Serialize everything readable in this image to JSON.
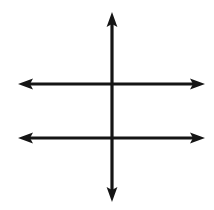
{
  "canvas": {
    "width": 214,
    "height": 210,
    "background_color": "#ffffff",
    "stroke_color": "#151515",
    "title": "Crossed double-headed arrows diagram"
  },
  "chart_data": {
    "type": "diagram",
    "title": "Crossed double-headed arrows diagram",
    "xlabel": "",
    "ylabel": "",
    "axis_ranges": {
      "x": [
        0,
        214
      ],
      "y": [
        0,
        210
      ]
    },
    "grid": false,
    "legend": false,
    "stroke_width": 3.2,
    "arrowhead": {
      "length": 15,
      "half_width": 5.4,
      "notch": 3.0
    },
    "shapes": [
      {
        "name": "vertical-double-arrow",
        "orientation": "vertical",
        "x": 112,
        "y_start": 12,
        "y_end": 202,
        "heads": [
          "start",
          "end"
        ],
        "color": "#151515"
      },
      {
        "name": "upper-horizontal-double-arrow",
        "orientation": "horizontal",
        "y": 84,
        "x_start": 18,
        "x_end": 205,
        "heads": [
          "start",
          "end"
        ],
        "color": "#151515"
      },
      {
        "name": "lower-horizontal-double-arrow",
        "orientation": "horizontal",
        "y": 138,
        "x_start": 18,
        "x_end": 205,
        "heads": [
          "start",
          "end"
        ],
        "color": "#151515"
      }
    ],
    "intersections": [
      {
        "name": "upper-crossing",
        "x": 112,
        "y": 84
      },
      {
        "name": "lower-crossing",
        "x": 112,
        "y": 138
      }
    ]
  }
}
